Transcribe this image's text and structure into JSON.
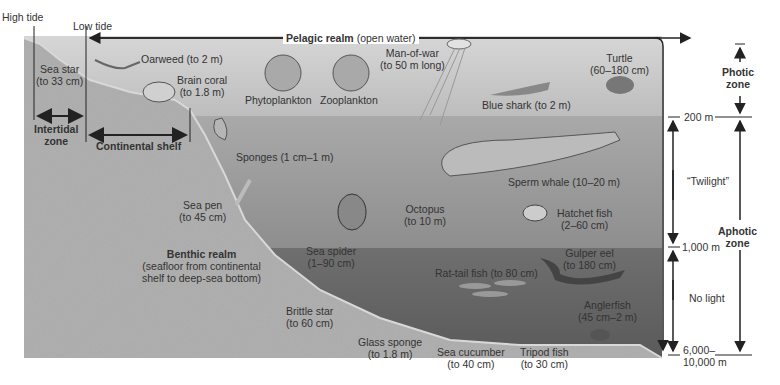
{
  "tide_labels": {
    "high": "High tide",
    "low": "Low tide"
  },
  "realms": {
    "pelagic": {
      "name": "Pelagic realm",
      "note": "(open water)"
    },
    "benthic": {
      "name": "Benthic realm",
      "note_line1": "(seafloor from continental",
      "note_line2": "shelf to deep-sea bottom)"
    }
  },
  "zones": {
    "intertidal": {
      "line1": "Intertidal",
      "line2": "zone"
    },
    "continental_shelf": "Continental shelf",
    "photic": {
      "line1": "Photic",
      "line2": "zone"
    },
    "aphotic": {
      "line1": "Aphotic",
      "line2": "zone"
    },
    "twilight": "“Twilight”",
    "no_light": "No light"
  },
  "depths": {
    "d200": "200 m",
    "d1000": "1,000 m",
    "dmax_line1": "6,000–",
    "dmax_line2": "10,000 m"
  },
  "organisms": [
    {
      "name": "Sea star",
      "size": "(to 33 cm)"
    },
    {
      "name": "Oarweed",
      "size": "(to 2 m)"
    },
    {
      "name": "Brain coral",
      "size": "(to 1.8 m)"
    },
    {
      "name": "Phytoplankton",
      "size": ""
    },
    {
      "name": "Zooplankton",
      "size": ""
    },
    {
      "name": "Man-of-war",
      "size": "(to 50 m long)"
    },
    {
      "name": "Blue shark",
      "size": "(to 2 m)"
    },
    {
      "name": "Turtle",
      "size": "(60–180 cm)"
    },
    {
      "name": "Sponges",
      "size": "(1 cm–1 m)"
    },
    {
      "name": "Sperm whale",
      "size": "(10–20 m)"
    },
    {
      "name": "Sea pen",
      "size": "(to 45 cm)"
    },
    {
      "name": "Octopus",
      "size": "(to 10 m)"
    },
    {
      "name": "Hatchet fish",
      "size": "(2–60 cm)"
    },
    {
      "name": "Sea spider",
      "size": "(1–90 cm)"
    },
    {
      "name": "Gulper eel",
      "size": "(to 180 cm)"
    },
    {
      "name": "Rat-tail fish",
      "size": "(to 80 cm)"
    },
    {
      "name": "Brittle star",
      "size": "(to 60 cm)"
    },
    {
      "name": "Anglerfish",
      "size": "(45 cm–2 m)"
    },
    {
      "name": "Glass sponge",
      "size": "(to 1.8 m)"
    },
    {
      "name": "Sea cucumber",
      "size": "(to 40 cm)"
    },
    {
      "name": "Tripod fish",
      "size": "(to 30 cm)"
    }
  ],
  "colors": {
    "photic_water": "#cbcbcb",
    "twilight_water": "#9a9a9a",
    "dark_water": "#656565",
    "seabed": "#a8a8a8",
    "line": "#222222"
  }
}
